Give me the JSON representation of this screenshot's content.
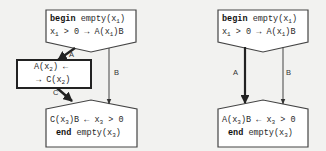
{
  "diagrams": [
    {
      "name": "left-flow",
      "top_node": {
        "line1_keyword": "begin",
        "line1_rest": "empty(x",
        "line1_sub": "1",
        "line1_close": ")",
        "line2_pre": "x",
        "line2_sub1": "1",
        "line2_mid": " > 0 → A(x",
        "line2_sub2": "1",
        "line2_post": ")B"
      },
      "middle_node": {
        "line1_pre": "A(x",
        "line1_sub": "2",
        "line1_post": ") ←",
        "line2_pre": "→ C(x",
        "line2_sub": "2",
        "line2_post": ")"
      },
      "bottom_node": {
        "line1_pre": "C(x",
        "line1_sub": "3",
        "line1_mid": ")B ← x",
        "line1_sub2": "3",
        "line1_post": " > 0",
        "line2_keyword": "end",
        "line2_rest": " empty(x",
        "line2_sub": "3",
        "line2_close": ")"
      },
      "edges": [
        {
          "label": "A",
          "from": "top_node",
          "to": "middle_node",
          "weight": "thick"
        },
        {
          "label": "B",
          "from": "top_node",
          "to": "bottom_node",
          "weight": "thin"
        },
        {
          "label": "C",
          "from": "middle_node",
          "to": "bottom_node",
          "weight": "thick"
        }
      ]
    },
    {
      "name": "right-flow",
      "top_node": {
        "line1_keyword": "begin",
        "line1_rest": "empty(x",
        "line1_sub": "1",
        "line1_close": ")",
        "line2_pre": "x",
        "line2_sub1": "1",
        "line2_mid": " > 0 → A(x",
        "line2_sub2": "1",
        "line2_post": ")B"
      },
      "bottom_node": {
        "line1_pre": "A(x",
        "line1_sub": "3",
        "line1_mid": ")B ← x",
        "line1_sub2": "3",
        "line1_post": " > 0",
        "line2_keyword": "end",
        "line2_rest": " empty(x",
        "line2_sub": "3",
        "line2_close": ")"
      },
      "edges": [
        {
          "label": "A",
          "from": "top_node",
          "to": "bottom_node",
          "weight": "thick"
        },
        {
          "label": "B",
          "from": "top_node",
          "to": "bottom_node",
          "weight": "thin"
        }
      ]
    }
  ],
  "colors": {
    "background": "#f2f2f0",
    "stroke": "#333333",
    "box_fill": "#ffffff"
  }
}
